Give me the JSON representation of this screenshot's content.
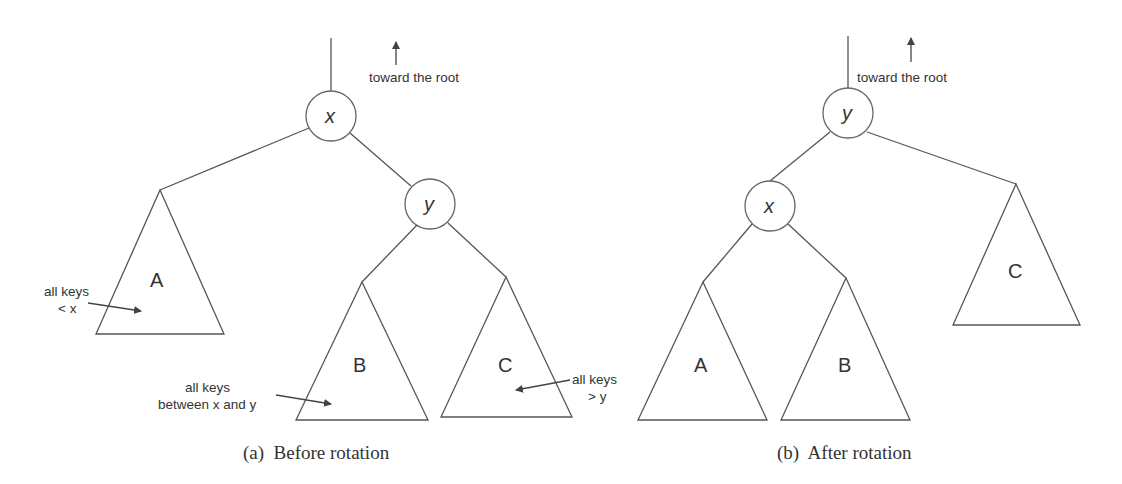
{
  "figure": {
    "colors": {
      "line": "#555555",
      "text": "#333333",
      "background": "#ffffff"
    }
  },
  "before": {
    "caption": "(a)  Before rotation",
    "root_note": "toward the root",
    "nodes": [
      {
        "id": "x",
        "label": "x",
        "cx": 331,
        "cy": 116
      },
      {
        "id": "y",
        "label": "y",
        "cx": 430,
        "cy": 204
      }
    ],
    "subtrees": [
      {
        "id": "A",
        "label": "A",
        "apex": [
          160,
          190
        ],
        "base": [
          96,
          224,
          334
        ],
        "annotation": [
          "all keys",
          "< x"
        ]
      },
      {
        "id": "B",
        "label": "B",
        "apex": [
          362,
          282
        ],
        "base": [
          296,
          428,
          420
        ],
        "annotation": [
          "all keys",
          "between x and y"
        ]
      },
      {
        "id": "C",
        "label": "C",
        "apex": [
          506,
          277
        ],
        "base": [
          441,
          572,
          417
        ],
        "annotation": [
          "all keys",
          "> y"
        ]
      }
    ]
  },
  "after": {
    "caption": "(b)  After rotation",
    "root_note": "toward the root",
    "nodes": [
      {
        "id": "y",
        "label": "y",
        "cx": 848,
        "cy": 113
      },
      {
        "id": "x",
        "label": "x",
        "cx": 770,
        "cy": 206
      }
    ],
    "subtrees": [
      {
        "id": "A",
        "label": "A",
        "apex": [
          703,
          282
        ],
        "base": [
          638,
          767,
          420
        ]
      },
      {
        "id": "B",
        "label": "B",
        "apex": [
          846,
          278
        ],
        "base": [
          781,
          910,
          420
        ]
      },
      {
        "id": "C",
        "label": "C",
        "apex": [
          1016,
          184
        ],
        "base": [
          953,
          1080,
          325
        ]
      }
    ]
  }
}
